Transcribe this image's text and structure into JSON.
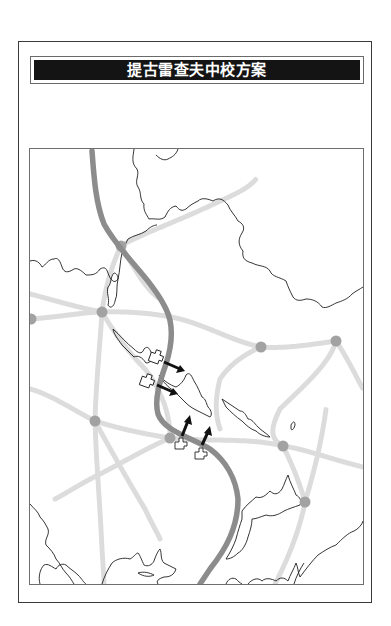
{
  "title": "提古雷查夫中校方案",
  "colors": {
    "frame": "#3a3a3a",
    "title_bg": "#141414",
    "title_text": "#ffffff",
    "border_line": "#1e1e1e",
    "front_line": "#8a8a8a",
    "road": "#d9d9d9",
    "city": "#a0a0a0",
    "arrow": "#111111",
    "unit_outline": "#222222"
  },
  "map": {
    "legend": [],
    "cities": [
      {
        "x": 91,
        "y": 97
      },
      {
        "x": 72,
        "y": 163
      },
      {
        "x": 1,
        "y": 170
      },
      {
        "x": 231,
        "y": 198
      },
      {
        "x": 306,
        "y": 192
      },
      {
        "x": 65,
        "y": 272
      },
      {
        "x": 140,
        "y": 289
      },
      {
        "x": 253,
        "y": 297
      },
      {
        "x": 275,
        "y": 353
      }
    ],
    "units": [
      {
        "id": "unit-1",
        "x": 121,
        "y": 202,
        "arrow_dir": "east-southeast"
      },
      {
        "id": "unit-2",
        "x": 113,
        "y": 228,
        "arrow_dir": "east-southeast"
      },
      {
        "id": "unit-3",
        "x": 147,
        "y": 290,
        "arrow_dir": "north-northeast"
      },
      {
        "id": "unit-4",
        "x": 167,
        "y": 304,
        "arrow_dir": "north-northeast"
      }
    ],
    "front_line_label": "front-line",
    "region_labels": []
  }
}
